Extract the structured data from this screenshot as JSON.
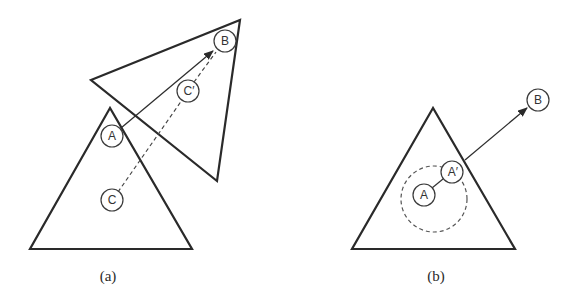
{
  "figure": {
    "panels": [
      {
        "id": "a",
        "caption": "(a)",
        "nodes": {
          "A": "A",
          "B": "B",
          "C": "C",
          "C_prime": "C′"
        }
      },
      {
        "id": "b",
        "caption": "(b)",
        "nodes": {
          "A": "A",
          "A_prime": "A′",
          "B": "B"
        }
      }
    ]
  }
}
